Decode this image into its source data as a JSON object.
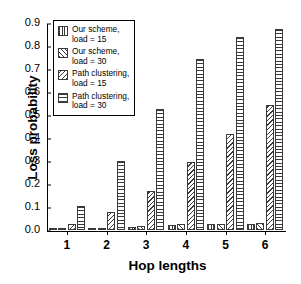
{
  "chart_data": {
    "type": "bar",
    "title": "",
    "xlabel": "Hop lengths",
    "ylabel": "Loss probability",
    "categories": [
      "1",
      "2",
      "3",
      "4",
      "5",
      "6"
    ],
    "ylim": [
      0.0,
      0.9
    ],
    "yticks": [
      "0.0",
      "0.1",
      "0.2",
      "0.3",
      "0.4",
      "0.5",
      "0.6",
      "0.7",
      "0.8",
      "0.9"
    ],
    "ytick_values": [
      0.0,
      0.1,
      0.2,
      0.3,
      0.4,
      0.5,
      0.6,
      0.7,
      0.8,
      0.9
    ],
    "grid": false,
    "legend_position": "upper left",
    "series": [
      {
        "name": "Our scheme,\nload = 15",
        "pattern": "vertical-lines",
        "values": [
          0.004,
          0.008,
          0.014,
          0.02,
          0.024,
          0.026
        ]
      },
      {
        "name": "Our scheme,\nload = 30",
        "pattern": "back-diagonal-lines",
        "values": [
          0.006,
          0.01,
          0.018,
          0.024,
          0.028,
          0.03
        ]
      },
      {
        "name": "Path clustering,\nload = 15",
        "pattern": "forward-diagonal-lines",
        "values": [
          0.025,
          0.08,
          0.17,
          0.296,
          0.418,
          0.542
        ]
      },
      {
        "name": "Path clustering,\nload = 30",
        "pattern": "horizontal-lines",
        "values": [
          0.105,
          0.302,
          0.527,
          0.745,
          0.838,
          0.872
        ]
      }
    ]
  },
  "legend": {
    "items": [
      {
        "label": "Our scheme,\nload = 15"
      },
      {
        "label": "Our scheme,\nload = 30"
      },
      {
        "label": "Path clustering,\nload = 15"
      },
      {
        "label": "Path clustering,\nload = 30"
      }
    ]
  }
}
